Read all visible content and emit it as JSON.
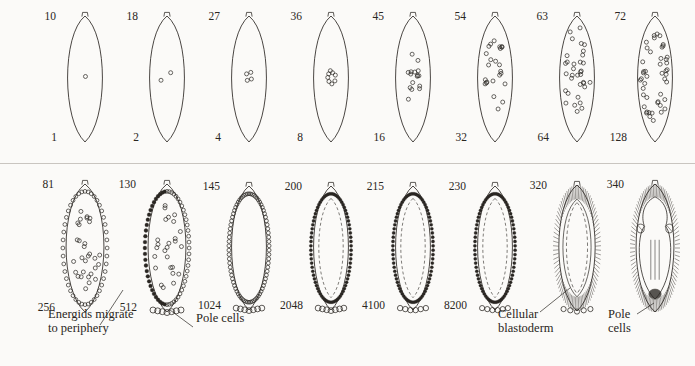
{
  "figure": {
    "title_fragment_cut_off_top": "",
    "ink_color": "#2a2622",
    "background_color": "#fbfaf8",
    "divider_color": "#c9c5c0"
  },
  "rows": [
    {
      "name": "row-top",
      "stages": [
        {
          "time": "10",
          "count": "1",
          "nuclei": 1,
          "pattern": "central",
          "cx": 85,
          "cy": 79,
          "rx": 23,
          "ry": 63
        },
        {
          "time": "18",
          "count": "2",
          "nuclei": 2,
          "pattern": "central",
          "cx": 167,
          "cy": 79,
          "rx": 23,
          "ry": 63
        },
        {
          "time": "27",
          "count": "4",
          "nuclei": 4,
          "pattern": "central",
          "cx": 249,
          "cy": 79,
          "rx": 23,
          "ry": 63
        },
        {
          "time": "36",
          "count": "8",
          "nuclei": 8,
          "pattern": "central",
          "cx": 331,
          "cy": 79,
          "rx": 23,
          "ry": 63
        },
        {
          "time": "45",
          "count": "16",
          "nuclei": 16,
          "pattern": "central",
          "cx": 413,
          "cy": 79,
          "rx": 23,
          "ry": 63
        },
        {
          "time": "54",
          "count": "32",
          "nuclei": 24,
          "pattern": "central",
          "cx": 495,
          "cy": 79,
          "rx": 23,
          "ry": 63
        },
        {
          "time": "63",
          "count": "64",
          "nuclei": 34,
          "pattern": "central",
          "cx": 577,
          "cy": 79,
          "rx": 23,
          "ry": 63
        },
        {
          "time": "72",
          "count": "128",
          "nuclei": 46,
          "pattern": "spreading",
          "cx": 655,
          "cy": 79,
          "rx": 23,
          "ry": 63
        }
      ]
    },
    {
      "name": "row-bottom",
      "stages": [
        {
          "time": "81",
          "count": "256",
          "pattern": "migrating",
          "cx": 85,
          "cy": 248,
          "rx": 25,
          "ry": 64
        },
        {
          "time": "130",
          "count": "512",
          "pattern": "migrating2",
          "cx": 167,
          "cy": 248,
          "rx": 25,
          "ry": 64
        },
        {
          "time": "145",
          "count": "1024",
          "pattern": "syncytial",
          "cx": 249,
          "cy": 248,
          "rx": 23,
          "ry": 62
        },
        {
          "time": "200",
          "count": "2048",
          "pattern": "syncytial2",
          "cx": 331,
          "cy": 248,
          "rx": 23,
          "ry": 62
        },
        {
          "time": "215",
          "count": "4100",
          "pattern": "syncytial3",
          "cx": 413,
          "cy": 248,
          "rx": 23,
          "ry": 62
        },
        {
          "time": "230",
          "count": "8200",
          "pattern": "syncytial4",
          "cx": 495,
          "cy": 248,
          "rx": 23,
          "ry": 62
        },
        {
          "time": "320",
          "count": "",
          "pattern": "cellular",
          "cx": 577,
          "cy": 248,
          "rx": 24,
          "ry": 63
        },
        {
          "time": "340",
          "count": "",
          "pattern": "gastrulating",
          "cx": 655,
          "cy": 248,
          "rx": 25,
          "ry": 64
        }
      ]
    }
  ],
  "annotations": [
    {
      "name": "energids-migrate",
      "line1": "Energids migrate",
      "line2": "to periphery",
      "x": 48,
      "y": 318
    },
    {
      "name": "pole-cells-left",
      "line1": "Pole cells",
      "line2": "",
      "x": 196,
      "y": 322
    },
    {
      "name": "cellular-blastoderm",
      "line1": "Cellular",
      "line2": "blastoderm",
      "x": 498,
      "y": 318
    },
    {
      "name": "pole-cells-right",
      "line1": "Pole",
      "line2": "cells",
      "x": 608,
      "y": 318
    }
  ],
  "leaders": [
    {
      "name": "leader-energids",
      "x1": 100,
      "y1": 325,
      "x2": 123,
      "y2": 290
    },
    {
      "name": "leader-pole-cells-left",
      "x1": 193,
      "y1": 327,
      "x2": 170,
      "y2": 310
    },
    {
      "name": "leader-cellular-blastoderm",
      "x1": 540,
      "y1": 312,
      "x2": 570,
      "y2": 288
    },
    {
      "name": "leader-pole-cells-right",
      "x1": 637,
      "y1": 314,
      "x2": 654,
      "y2": 303
    }
  ]
}
